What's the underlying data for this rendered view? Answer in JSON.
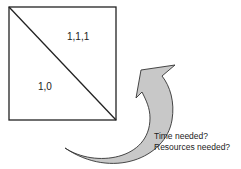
{
  "diagram": {
    "square": {
      "upper_right_label": "1,1,1",
      "lower_left_label": "1,0"
    },
    "arrow": {
      "fill": "#c8c8c8",
      "stroke": "#333333"
    },
    "questions": [
      "Time needed?",
      "Resources needed?"
    ]
  }
}
